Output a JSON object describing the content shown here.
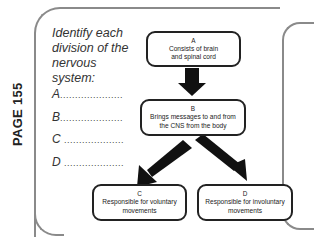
{
  "page_label": "PAGE 155",
  "prompt": "Identify each division of the nervous system:",
  "answer_lines": [
    {
      "letter": "A",
      "dots": "....................."
    },
    {
      "letter": "B",
      "dots": "....................."
    },
    {
      "letter": "C",
      "dots": "...................."
    },
    {
      "letter": "D",
      "dots": "...................."
    }
  ],
  "diagram": {
    "box_a": {
      "letter": "A",
      "line1": "Consists of brain",
      "line2": "and spinal cord"
    },
    "box_b": {
      "letter": "B",
      "line1": "Brings messages to and from",
      "line2": "the CNS from the body"
    },
    "box_c": {
      "letter": "C",
      "line1": "Responsible for voluntary",
      "line2": "movements"
    },
    "box_d": {
      "letter": "D",
      "line1": "Responsible for involuntary",
      "line2": "movements"
    }
  }
}
